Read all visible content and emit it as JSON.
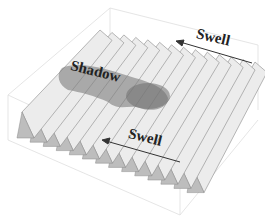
{
  "diagram": {
    "title": "",
    "labels": {
      "swell_top": "Swell",
      "swell_bottom": "Swell",
      "shadow": "Shadow"
    },
    "arrows": [
      {
        "name": "swell-arrow-top",
        "label": "Swell",
        "direction": "toward-upper-left"
      },
      {
        "name": "swell-arrow-bottom",
        "label": "Swell",
        "direction": "toward-upper-left"
      }
    ],
    "colors": {
      "background": "#ffffff",
      "ridge_light": "#ececec",
      "ridge_dark": "#bdbdbd",
      "ridge_edge": "#8a8a8a",
      "shadow": "#8c8c8c",
      "box": "#dcdcdc",
      "text": "#222222"
    },
    "ridge_count": 14
  }
}
